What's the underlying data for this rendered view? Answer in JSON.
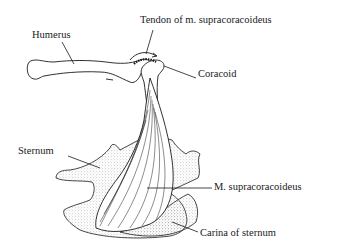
{
  "diagram": {
    "labels": {
      "humerus": "Humerus",
      "tendon": "Tendon of m. supracoracoideus",
      "coracoid": "Coracoid",
      "sternum": "Sternum",
      "muscle": "M. supracoracoideus",
      "carina": "Carina of sternum"
    },
    "colors": {
      "ink": "#1a1a1a",
      "stipple": "#9a9a9a",
      "background": "#ffffff"
    }
  }
}
